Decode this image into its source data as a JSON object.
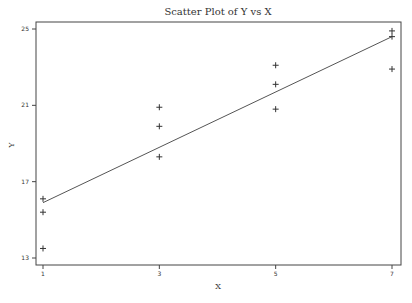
{
  "chart_data": {
    "type": "scatter",
    "title": "Scatter Plot of Y vs X",
    "xlabel": "X",
    "ylabel": "Y",
    "xlim": [
      1,
      7
    ],
    "ylim": [
      13,
      25
    ],
    "xticks": [
      1,
      3,
      5,
      7
    ],
    "yticks": [
      13,
      17,
      21,
      25
    ],
    "grid": false,
    "legend": null,
    "series": [
      {
        "name": "Y",
        "marker": "+",
        "points": [
          {
            "x": 1,
            "y": 16.1
          },
          {
            "x": 1,
            "y": 15.4
          },
          {
            "x": 1,
            "y": 13.5
          },
          {
            "x": 3,
            "y": 20.9
          },
          {
            "x": 3,
            "y": 19.9
          },
          {
            "x": 3,
            "y": 18.3
          },
          {
            "x": 5,
            "y": 23.1
          },
          {
            "x": 5,
            "y": 22.1
          },
          {
            "x": 5,
            "y": 20.8
          },
          {
            "x": 7,
            "y": 24.9
          },
          {
            "x": 7,
            "y": 24.6
          },
          {
            "x": 7,
            "y": 22.9
          }
        ]
      }
    ],
    "fit_line": {
      "x": [
        1,
        7
      ],
      "y": [
        15.9,
        24.6
      ]
    }
  }
}
